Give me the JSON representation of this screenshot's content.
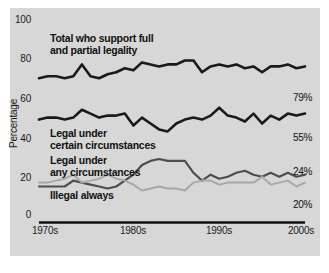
{
  "chart_data": {
    "type": "line",
    "title": "",
    "xlabel": "",
    "ylabel": "Percentage",
    "ylim": [
      0,
      100
    ],
    "yticks": [
      0,
      20,
      40,
      60,
      80,
      100
    ],
    "xticks": [
      "1970s",
      "1980s",
      "1990s",
      "2000s"
    ],
    "xlim": [
      1975,
      2006
    ],
    "grid": false,
    "legend_position": "inline-labels",
    "x": [
      1975,
      1976,
      1977,
      1978,
      1979,
      1980,
      1981,
      1982,
      1983,
      1984,
      1985,
      1986,
      1987,
      1988,
      1989,
      1990,
      1991,
      1992,
      1993,
      1994,
      1995,
      1996,
      1997,
      1998,
      1999,
      2000,
      2001,
      2002,
      2003,
      2004,
      2005,
      2006
    ],
    "series": [
      {
        "name": "Total who support full and partial legality",
        "color": "#1a1a1a",
        "end_label": "79%",
        "values": [
          73,
          74,
          74,
          73,
          74,
          80,
          74,
          73,
          75,
          76,
          78,
          77,
          81,
          80,
          79,
          80,
          80,
          82,
          82,
          76,
          79,
          80,
          79,
          80,
          78,
          79,
          76,
          79,
          79,
          80,
          78,
          79
        ]
      },
      {
        "name": "Legal under certain circumstances",
        "color": "#1a1a1a",
        "end_label": "55%",
        "values": [
          52,
          53,
          53,
          52,
          53,
          57,
          55,
          53,
          54,
          54,
          55,
          49,
          53,
          50,
          47,
          46,
          50,
          52,
          53,
          52,
          54,
          58,
          54,
          53,
          51,
          55,
          50,
          54,
          52,
          55,
          54,
          55
        ]
      },
      {
        "name": "Legal under any circumstances",
        "color": "#4d4d4d",
        "end_label": "24%",
        "values": [
          18,
          18,
          18,
          18,
          21,
          20,
          19,
          18,
          17,
          18,
          21,
          24,
          29,
          31,
          32,
          31,
          31,
          31,
          25,
          21,
          24,
          22,
          23,
          25,
          26,
          24,
          23,
          25,
          23,
          25,
          23,
          24
        ]
      },
      {
        "name": "Illegal always",
        "color": "#a8a8a8",
        "end_label": "20%",
        "values": [
          20,
          20,
          21,
          22,
          24,
          20,
          21,
          22,
          24,
          22,
          21,
          19,
          16,
          17,
          18,
          17,
          17,
          16,
          20,
          21,
          21,
          19,
          20,
          20,
          20,
          20,
          23,
          19,
          20,
          21,
          18,
          20
        ]
      }
    ],
    "series_labels": [
      {
        "text": "Total who support full\nand partial legality",
        "x": 50,
        "y": 33
      },
      {
        "text": "Legal under\ncertain circumstances",
        "x": 50,
        "y": 128
      },
      {
        "text": "Legal under\nany circumstances",
        "x": 50,
        "y": 155
      },
      {
        "text": "Illegal always",
        "x": 50,
        "y": 190
      }
    ],
    "end_labels": [
      {
        "text": "79%",
        "x": 293,
        "y": 92
      },
      {
        "text": "55%",
        "x": 293,
        "y": 132
      },
      {
        "text": "24%",
        "x": 293,
        "y": 166
      },
      {
        "text": "20%",
        "x": 293,
        "y": 199
      }
    ],
    "ytick_positions": [
      {
        "label": "100",
        "y": 20
      },
      {
        "label": "80",
        "y": 59
      },
      {
        "label": "60",
        "y": 99
      },
      {
        "label": "40",
        "y": 139
      },
      {
        "label": "20",
        "y": 178
      },
      {
        "label": "0",
        "y": 215
      }
    ],
    "xtick_positions": [
      {
        "label": "1970s",
        "x": 22
      },
      {
        "label": "1980s",
        "x": 110
      },
      {
        "label": "1990s",
        "x": 196
      },
      {
        "label": "2000s",
        "x": 278
      }
    ],
    "colors": {
      "panel_background": "#d7d7d7",
      "page_background": "#ffffff",
      "axis": "#111111",
      "text": "#1a1a1a"
    }
  }
}
